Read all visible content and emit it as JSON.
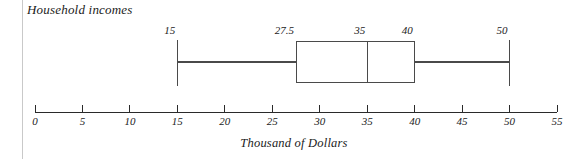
{
  "chart_data": {
    "type": "box",
    "title": "Household incomes",
    "xlabel": "Thousand of Dollars",
    "ylabel": "",
    "orientation": "horizontal",
    "xlim": [
      0,
      55
    ],
    "grid": false,
    "legend": null,
    "tick_labels": [
      "0",
      "5",
      "10",
      "15",
      "20",
      "25",
      "30",
      "35",
      "40",
      "45",
      "50",
      "55"
    ],
    "tick_values": [
      0,
      5,
      10,
      15,
      20,
      25,
      30,
      35,
      40,
      45,
      50,
      55
    ],
    "tick_step": 5,
    "series": [
      {
        "name": "Household incomes",
        "min": 15,
        "q1": 27.5,
        "median": 35,
        "q3": 40,
        "max": 50,
        "outliers": []
      }
    ],
    "value_labels": [
      {
        "text": "15",
        "value": 15,
        "marker": "min"
      },
      {
        "text": "27.5",
        "value": 27.5,
        "marker": "q1"
      },
      {
        "text": "35",
        "value": 35,
        "marker": "median"
      },
      {
        "text": "40",
        "value": 40,
        "marker": "q3"
      },
      {
        "text": "50",
        "value": 50,
        "marker": "max"
      }
    ],
    "colors": {
      "line": "#4a4a4a",
      "axis": "#2a2a2a",
      "text": "#1b1b1b",
      "background": "#ffffff"
    }
  }
}
